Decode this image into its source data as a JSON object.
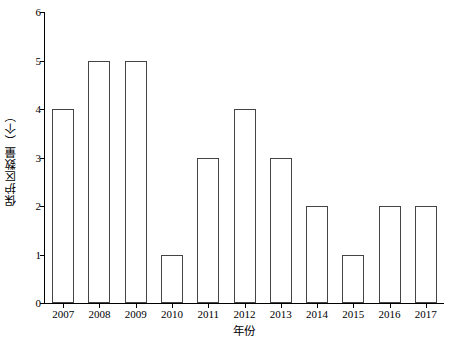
{
  "chart_data": {
    "type": "bar",
    "title": "",
    "xlabel": "年份",
    "ylabel": "保护区数量（个）",
    "categories": [
      "2007",
      "2008",
      "2009",
      "2010",
      "2011",
      "2012",
      "2013",
      "2014",
      "2015",
      "2016",
      "2017"
    ],
    "values": [
      4,
      5,
      5,
      1,
      3,
      4,
      3,
      2,
      1,
      2,
      2
    ],
    "ylim": [
      0,
      6
    ],
    "y_ticks": [
      "0",
      "1",
      "2",
      "3",
      "4",
      "5",
      "6"
    ],
    "grid": false,
    "legend": "none",
    "bar_fill": "#ffffff",
    "bar_edge": "#444444",
    "axis_color": "#000000"
  }
}
